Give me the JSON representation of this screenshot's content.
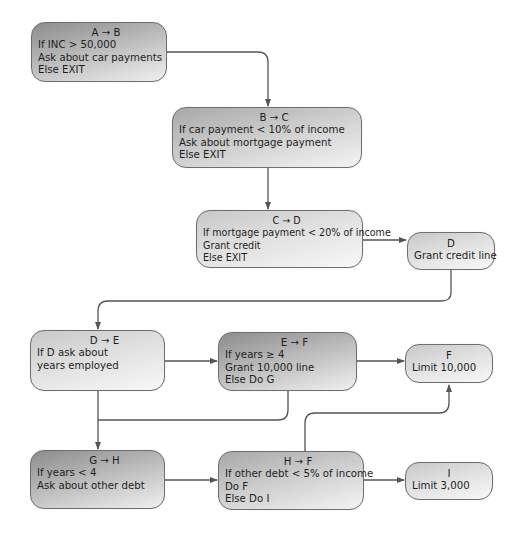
{
  "diagram": {
    "type": "flowchart",
    "nodes": [
      {
        "id": "AB",
        "title": "A → B",
        "lines": [
          "If INC > 50,000",
          "Ask about car payments",
          "Else EXIT"
        ]
      },
      {
        "id": "BC",
        "title": "B → C",
        "lines": [
          "If car payment < 10% of income",
          "Ask about mortgage payment",
          "Else EXIT"
        ]
      },
      {
        "id": "CD",
        "title": "C → D",
        "lines": [
          "If mortgage payment < 20% of income",
          "Grant credit",
          "Else EXIT"
        ]
      },
      {
        "id": "D",
        "title": "D",
        "lines": [
          "Grant credit line"
        ]
      },
      {
        "id": "DE",
        "title": "D → E",
        "lines": [
          "If D ask about",
          "years employed"
        ]
      },
      {
        "id": "EF",
        "title": "E → F",
        "lines": [
          "If years ≥ 4",
          "Grant 10,000 line",
          "Else Do G"
        ]
      },
      {
        "id": "F",
        "title": "F",
        "lines": [
          "Limit 10,000"
        ]
      },
      {
        "id": "GH",
        "title": "G → H",
        "lines": [
          "If years < 4",
          "Ask about other debt"
        ]
      },
      {
        "id": "HF",
        "title": "H → F",
        "lines": [
          "If other debt < 5% of income",
          "Do F",
          "Else Do I"
        ]
      },
      {
        "id": "I",
        "title": "I",
        "lines": [
          "Limit 3,000"
        ]
      }
    ],
    "edges": [
      {
        "from": "AB",
        "to": "BC"
      },
      {
        "from": "BC",
        "to": "CD"
      },
      {
        "from": "CD",
        "to": "D"
      },
      {
        "from": "D",
        "to": "DE"
      },
      {
        "from": "DE",
        "to": "EF"
      },
      {
        "from": "EF",
        "to": "F"
      },
      {
        "from": "DE",
        "to": "GH"
      },
      {
        "from": "EF",
        "to": "GH"
      },
      {
        "from": "GH",
        "to": "HF"
      },
      {
        "from": "HF",
        "to": "F"
      },
      {
        "from": "HF",
        "to": "I"
      }
    ],
    "colors": {
      "line": "#555555",
      "border": "#6f6f6f",
      "text": "#1e1e1e"
    }
  }
}
